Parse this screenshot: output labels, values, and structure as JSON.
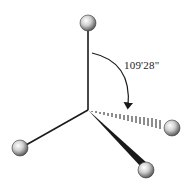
{
  "diagram": {
    "angle_label": "109°28''",
    "angle_label_display": "109'28\"",
    "center": {
      "x": 88,
      "y": 110
    },
    "atoms": [
      {
        "id": "top",
        "x": 88,
        "y": 23,
        "r": 8,
        "bond": "plain"
      },
      {
        "id": "right",
        "x": 172,
        "y": 128,
        "r": 8,
        "bond": "hashed-wedge"
      },
      {
        "id": "bottom-right",
        "x": 146,
        "y": 170,
        "r": 8,
        "bond": "solid-wedge"
      },
      {
        "id": "left",
        "x": 20,
        "y": 148,
        "r": 8,
        "bond": "plain"
      }
    ],
    "colors": {
      "bond": "#1a1a1a",
      "atom_light": "#f4f4f4",
      "atom_dark": "#5a5a5a",
      "background": "#ffffff"
    }
  }
}
